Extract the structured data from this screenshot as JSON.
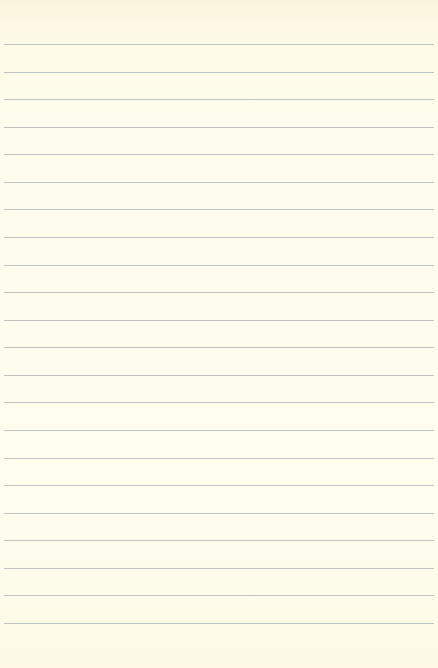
{
  "paper": {
    "type": "lined-notebook-paper",
    "background_color": "#fefcec",
    "line_color": "#b9bcbf",
    "line_count": 22,
    "first_line_y": 44,
    "line_spacing": 27.57,
    "line_left": 4,
    "line_right": 4
  }
}
